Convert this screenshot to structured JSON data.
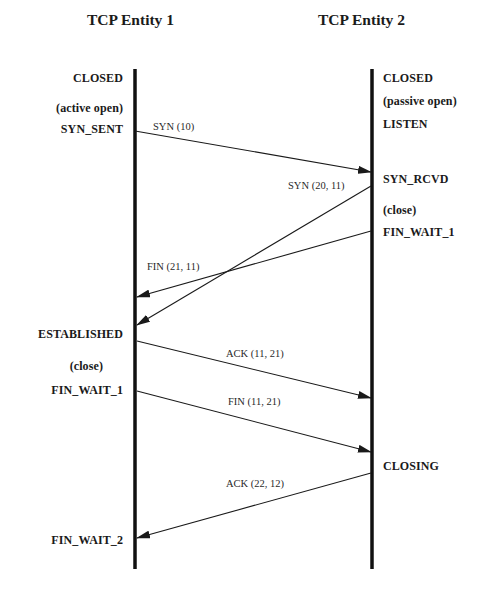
{
  "diagram": {
    "entities": [
      {
        "name": "TCP Entity 1",
        "x": 135
      },
      {
        "name": "TCP Entity 2",
        "x": 372
      }
    ],
    "entity1_states": [
      {
        "label": "CLOSED",
        "y": 78
      },
      {
        "label": "(active open)",
        "y": 109
      },
      {
        "label": "SYN_SENT",
        "y": 130
      },
      {
        "label": "ESTABLISHED",
        "y": 334
      },
      {
        "label": "(close)",
        "y": 366
      },
      {
        "label": "FIN_WAIT_1",
        "y": 391
      },
      {
        "label": "FIN_WAIT_2",
        "y": 540
      }
    ],
    "entity2_states": [
      {
        "label": "CLOSED",
        "y": 78
      },
      {
        "label": "(passive open)",
        "y": 102
      },
      {
        "label": "LISTEN",
        "y": 125
      },
      {
        "label": "SYN_RCVD",
        "y": 180
      },
      {
        "label": "(close)",
        "y": 211
      },
      {
        "label": "FIN_WAIT_1",
        "y": 233
      },
      {
        "label": "CLOSING",
        "y": 466
      }
    ],
    "messages": [
      {
        "label": "SYN (10)",
        "from": "TCP Entity 1",
        "to": "TCP Entity 2",
        "x1": 135,
        "y1": 131,
        "x2": 371,
        "y2": 172
      },
      {
        "label": "SYN (20, 11)",
        "from": "TCP Entity 2",
        "to": "TCP Entity 1",
        "x1": 371,
        "y1": 186,
        "x2": 137,
        "y2": 325
      },
      {
        "label": "FIN (21, 11)",
        "from": "TCP Entity 2",
        "to": "TCP Entity 1",
        "x1": 371,
        "y1": 231,
        "x2": 137,
        "y2": 297
      },
      {
        "label": "ACK (11, 21)",
        "from": "TCP Entity 1",
        "to": "TCP Entity 2",
        "x1": 137,
        "y1": 341,
        "x2": 371,
        "y2": 398
      },
      {
        "label": "FIN (11, 21)",
        "from": "TCP Entity 1",
        "to": "TCP Entity 2",
        "x1": 137,
        "y1": 391,
        "x2": 371,
        "y2": 452
      },
      {
        "label": "ACK (22, 12)",
        "from": "TCP Entity 2",
        "to": "TCP Entity 1",
        "x1": 371,
        "y1": 473,
        "x2": 137,
        "y2": 538
      }
    ]
  }
}
